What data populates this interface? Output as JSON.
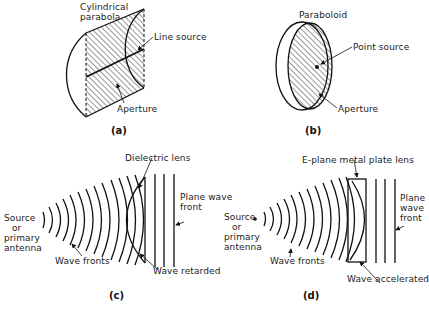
{
  "figure": {
    "panels": [
      {
        "id": "a",
        "caption": "(a)",
        "labels": {
          "reflector": "Cylindrical parabola",
          "reflector_line1": "Cylindrical",
          "reflector_line2": "parabola",
          "source": "Line source",
          "aperture": "Aperture"
        }
      },
      {
        "id": "b",
        "caption": "(b)",
        "labels": {
          "reflector": "Paraboloid",
          "source": "Point source",
          "aperture": "Aperture"
        }
      },
      {
        "id": "c",
        "caption": "(c)",
        "labels": {
          "lens": "Dielectric lens",
          "source_line1": "Source",
          "source_line2": "or",
          "source_line3": "primary",
          "source_line4": "antenna",
          "plane_line1": "Plane wave",
          "plane_line2": "front",
          "wave_fronts": "Wave fronts",
          "effect": "Wave retarded"
        }
      },
      {
        "id": "d",
        "caption": "(d)",
        "labels": {
          "lens": "E-plane metal plate lens",
          "source_line1": "Source",
          "source_line2": "or",
          "source_line3": "primary",
          "source_line4": "antenna",
          "plane_line1": "Plane",
          "plane_line2": "wave",
          "plane_line3": "front",
          "wave_fronts": "Wave fronts",
          "effect": "Wave accelerated"
        }
      }
    ]
  }
}
